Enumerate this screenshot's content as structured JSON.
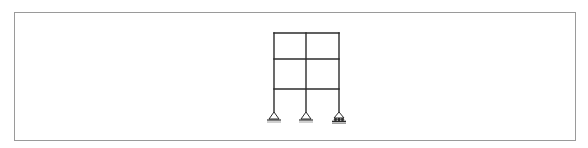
{
  "diagram": {
    "type": "structural-frame",
    "bays": 2,
    "stories": 3,
    "columns_x": [
      274,
      306,
      339
    ],
    "levels_y": [
      33,
      59,
      89,
      112
    ],
    "supports": [
      {
        "x": 274,
        "type": "pin"
      },
      {
        "x": 306,
        "type": "pin"
      },
      {
        "x": 339,
        "type": "roller"
      }
    ],
    "colors": {
      "line": "#2b2b2b",
      "border": "#9a9a9a",
      "background": "#ffffff"
    }
  }
}
